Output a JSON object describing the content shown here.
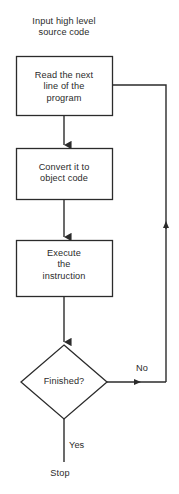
{
  "diagram": {
    "caption": "Input high level\nsource code",
    "nodes": [
      {
        "id": "read",
        "type": "process",
        "label": "Read the next\nline of the\nprogram"
      },
      {
        "id": "convert",
        "type": "process",
        "label": "Convert it to\nobject code"
      },
      {
        "id": "execute",
        "type": "process",
        "label": "Execute\nthe\ninstruction"
      },
      {
        "id": "finished",
        "type": "decision",
        "label": "Finished?"
      }
    ],
    "edge_labels": {
      "no": "No",
      "yes": "Yes"
    },
    "terminal": "Stop",
    "colors": {
      "stroke": "#2b2b2b",
      "background": "#ffffff",
      "text": "#2b2b2b"
    }
  }
}
